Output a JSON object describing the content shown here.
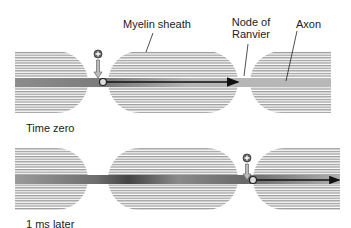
{
  "labels": {
    "myelin_sheath": "Myelin sheath",
    "node_of_ranvier_line1": "Node of",
    "node_of_ranvier_line2": "Ranvier",
    "axon": "Axon",
    "time_zero": "Time zero",
    "one_ms_later": "1 ms later"
  },
  "panels": [
    {
      "name": "time-zero",
      "caption": "Time zero",
      "charge_marker": "+",
      "marker_position": "first node",
      "arrow_extent": "to next node"
    },
    {
      "name": "1-ms-later",
      "caption": "1 ms later",
      "charge_marker": "+",
      "marker_position": "second node",
      "arrow_extent": "to end"
    }
  ],
  "colors": {
    "myelin_line": "#8a8a8a",
    "axon_fill": "#9a9a9a",
    "axon_dark": "#555555",
    "arrow": "#111111",
    "text": "#222222"
  }
}
